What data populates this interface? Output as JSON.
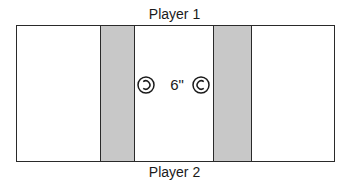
{
  "diagram": {
    "top_label": "Player 1",
    "bottom_label": "Player 2",
    "distance_label": "6\"",
    "markers": [
      {
        "name": "reversed-c-circle-icon",
        "glyph": "Ↄ"
      },
      {
        "name": "c-circle-icon",
        "glyph": "C"
      }
    ],
    "colors": {
      "border": "#2a2a2a",
      "band_fill": "#c8c8c8",
      "background": "#ffffff"
    }
  }
}
